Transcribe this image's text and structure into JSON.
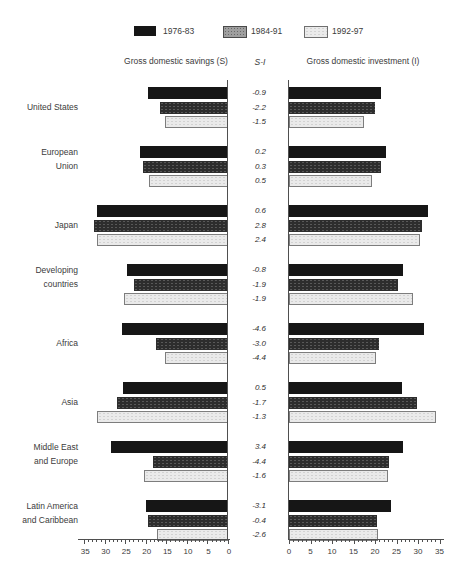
{
  "legend": {
    "items": [
      {
        "label": "1976-83",
        "color": "#161616",
        "style": "solid-black"
      },
      {
        "label": "1984-91",
        "color": "#9f9f9f",
        "style": "speckled-gray"
      },
      {
        "label": "1992-97",
        "color": "#ebebeb",
        "style": "light-gray-outlined"
      }
    ]
  },
  "headers": {
    "left": "Gross domestic savings (S)",
    "middle": "S-I",
    "right": "Gross domestic investment (I)"
  },
  "chart_data": {
    "type": "bar",
    "subtype": "horizontal back-to-back (savings left, investment right)",
    "periods": [
      "1976-83",
      "1984-91",
      "1992-97"
    ],
    "axis": {
      "ticks": [
        0,
        5,
        10,
        15,
        20,
        25,
        30,
        35
      ],
      "max": 35,
      "minor_tick_step": 1,
      "left_axis_reversed": true
    },
    "units": "percent of GDP (implied)",
    "regions": [
      {
        "name": [
          "United States"
        ],
        "savings": [
          19.5,
          16.5,
          15.3
        ],
        "s_minus_i": [
          "-0.9",
          "-2.2",
          "-1.5"
        ],
        "investment": [
          21.4,
          20.0,
          17.4
        ]
      },
      {
        "name": [
          "European",
          "Union"
        ],
        "savings": [
          21.4,
          20.7,
          19.2
        ],
        "s_minus_i": [
          "0.2",
          "0.3",
          "0.5"
        ],
        "investment": [
          22.6,
          21.4,
          19.3
        ]
      },
      {
        "name": [
          "Japan"
        ],
        "savings": [
          31.9,
          32.6,
          31.9
        ],
        "s_minus_i": [
          "0.6",
          "2.8",
          "2.4"
        ],
        "investment": [
          32.3,
          30.9,
          30.5
        ]
      },
      {
        "name": [
          "Developing",
          "countries"
        ],
        "savings": [
          24.6,
          22.9,
          25.3
        ],
        "s_minus_i": [
          "-0.8",
          "-1.9",
          "-1.9"
        ],
        "investment": [
          26.5,
          25.3,
          28.8
        ]
      },
      {
        "name": [
          "Africa"
        ],
        "savings": [
          25.8,
          17.5,
          15.3
        ],
        "s_minus_i": [
          "-4.6",
          "-3.0",
          "-4.4"
        ],
        "investment": [
          31.4,
          20.9,
          20.2
        ]
      },
      {
        "name": [
          "Asia"
        ],
        "savings": [
          25.5,
          27.0,
          31.9
        ],
        "s_minus_i": [
          "0.5",
          "-1.7",
          "-1.3"
        ],
        "investment": [
          26.3,
          29.8,
          34.2
        ]
      },
      {
        "name": [
          "Middle East",
          "and Europe"
        ],
        "savings": [
          28.5,
          18.2,
          20.4
        ],
        "s_minus_i": [
          "3.4",
          "-4.4",
          "-1.6"
        ],
        "investment": [
          26.5,
          23.3,
          23.0
        ]
      },
      {
        "name": [
          "Latin America",
          "and Caribbean"
        ],
        "savings": [
          20.0,
          19.5,
          17.3
        ],
        "s_minus_i": [
          "-3.1",
          "-0.4",
          "-2.6"
        ],
        "investment": [
          23.7,
          20.5,
          20.7
        ]
      }
    ]
  }
}
